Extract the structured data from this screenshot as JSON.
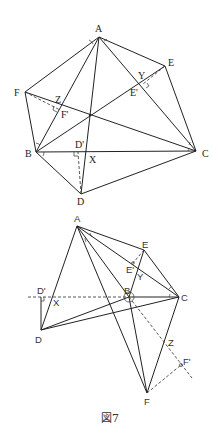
{
  "figure": {
    "caption": "図7",
    "top": {
      "labels": {
        "A": "A",
        "B": "B",
        "C": "C",
        "D": "D",
        "E": "E",
        "F": "F",
        "X": "X",
        "Y": "Y",
        "Z": "Z",
        "Dp": "D'",
        "Ep": "E'",
        "Fp": "F'"
      }
    },
    "bottom": {
      "labels": {
        "A": "A",
        "B": "B",
        "C": "C",
        "D": "D",
        "E": "E",
        "F": "F",
        "X": "X",
        "Y": "Y",
        "Z": "Z",
        "Dp": "D'",
        "Ep": "E'",
        "Fp": "F'"
      }
    }
  }
}
